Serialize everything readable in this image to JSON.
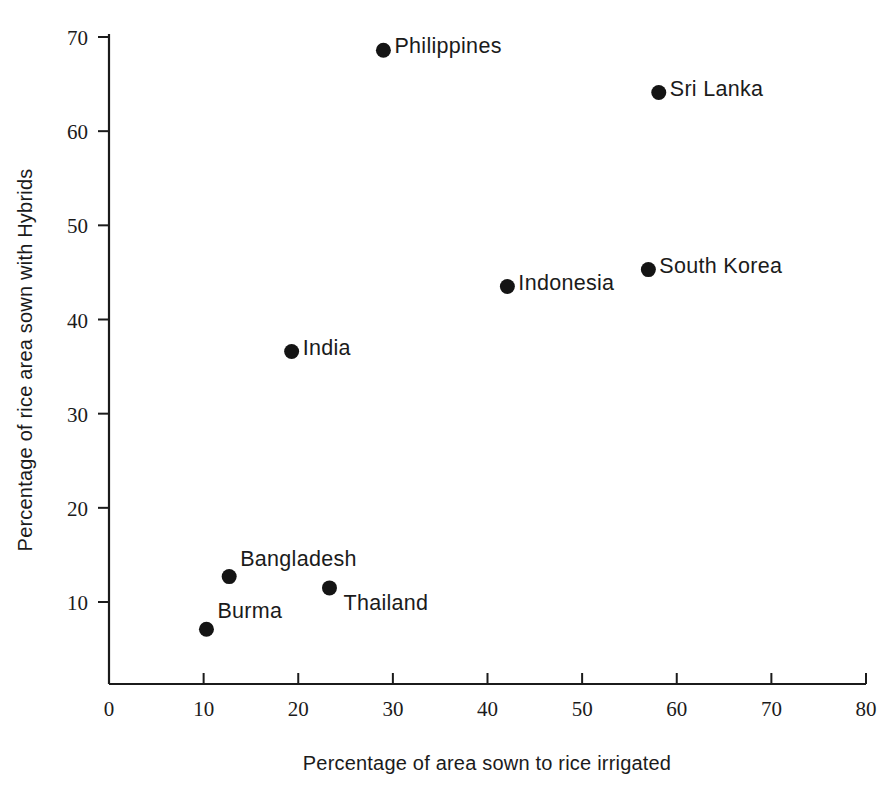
{
  "chart_data": {
    "type": "scatter",
    "title": "",
    "xlabel": "Percentage of area sown to rice irrigated",
    "ylabel": "Percentage of rice area sown with Hybrids",
    "xlim": [
      0,
      80
    ],
    "ylim": [
      0,
      72
    ],
    "grid": false,
    "legend": "none",
    "xticks": [
      0,
      10,
      20,
      30,
      40,
      50,
      60,
      70,
      80
    ],
    "xtick_labels": [
      "0",
      "10",
      "20",
      "30",
      "40",
      "50",
      "60",
      "70",
      "80"
    ],
    "yticks": [
      10,
      20,
      30,
      40,
      50,
      60,
      70
    ],
    "ytick_labels": [
      "10",
      "20",
      "30",
      "40",
      "50",
      "60",
      "70"
    ],
    "points": [
      {
        "label": "Philippines",
        "x": 29.0,
        "y": 68.6,
        "label_pos": "right"
      },
      {
        "label": "Sri Lanka",
        "x": 58.1,
        "y": 64.1,
        "label_pos": "right"
      },
      {
        "label": "South Korea",
        "x": 57.0,
        "y": 45.3,
        "label_pos": "right"
      },
      {
        "label": "Indonesia",
        "x": 42.1,
        "y": 43.5,
        "label_pos": "right"
      },
      {
        "label": "India",
        "x": 19.3,
        "y": 36.6,
        "label_pos": "right"
      },
      {
        "label": "Bangladesh",
        "x": 12.7,
        "y": 12.7,
        "label_pos": "right-up"
      },
      {
        "label": "Thailand",
        "x": 23.3,
        "y": 11.5,
        "label_pos": "right-down"
      },
      {
        "label": "Burma",
        "x": 10.3,
        "y": 7.1,
        "label_pos": "right-up"
      }
    ]
  },
  "axis": {
    "x_title": "Percentage of area sown to rice irrigated",
    "y_title": "Percentage of rice area sown with Hybrids",
    "x_tick_labels": [
      "0",
      "10",
      "20",
      "30",
      "40",
      "50",
      "60",
      "70",
      "80"
    ],
    "y_tick_labels": [
      "70",
      "60",
      "50",
      "40",
      "30",
      "20",
      "10"
    ]
  },
  "series_labels": {
    "philippines": "Philippines",
    "sri_lanka": "Sri Lanka",
    "south_korea": "South Korea",
    "indonesia": "Indonesia",
    "india": "India",
    "bangladesh": "Bangladesh",
    "thailand": "Thailand",
    "burma": "Burma"
  },
  "colors": {
    "point": "#141414",
    "axis": "#1b1b1b",
    "background": "#ffffff"
  }
}
